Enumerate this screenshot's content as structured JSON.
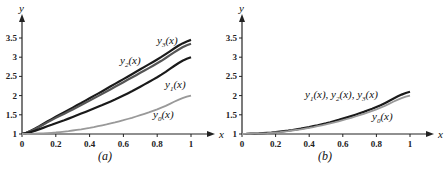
{
  "chart_data": [
    {
      "type": "line",
      "panel": "(a)",
      "caption": "(a)",
      "xlabel": "x",
      "ylabel": "y",
      "xlim": [
        0,
        1
      ],
      "ylim": [
        1,
        3.7
      ],
      "x_ticks": [
        "0",
        "0.2",
        "0.4",
        "0.6",
        "0.8",
        "1"
      ],
      "y_ticks": [
        "1",
        "1.5",
        "2",
        "2.5",
        "3",
        "3.5"
      ],
      "x": [
        0,
        0.2,
        0.4,
        0.6,
        0.8,
        1.0
      ],
      "series": [
        {
          "name": "y3(x)",
          "label": "y3(x)",
          "color": "#1a1a1a",
          "values": [
            1.0,
            1.45,
            1.93,
            2.43,
            2.94,
            3.45
          ]
        },
        {
          "name": "y2(x)",
          "label": "y2(x)",
          "color": "#555555",
          "values": [
            1.0,
            1.42,
            1.87,
            2.35,
            2.84,
            3.35
          ]
        },
        {
          "name": "y1(x)",
          "label": "y1(x)",
          "color": "#1a1a1a",
          "values": [
            1.0,
            1.28,
            1.62,
            2.0,
            2.48,
            3.0
          ]
        },
        {
          "name": "y0(x)",
          "label": "y0(x)",
          "color": "#999999",
          "values": [
            1.0,
            1.04,
            1.16,
            1.36,
            1.64,
            2.0
          ]
        }
      ],
      "grid": false
    },
    {
      "type": "line",
      "panel": "(b)",
      "caption": "(b)",
      "xlabel": "x",
      "ylabel": "y",
      "xlim": [
        0,
        1
      ],
      "ylim": [
        1,
        3.7
      ],
      "x_ticks": [
        "0",
        "0.2",
        "0.4",
        "0.6",
        "0.8",
        "1"
      ],
      "y_ticks": [
        "1",
        "1.5",
        "2",
        "2.5",
        "3",
        "3.5"
      ],
      "x": [
        0,
        0.2,
        0.4,
        0.6,
        0.8,
        1.0
      ],
      "series": [
        {
          "name": "y1(x), y2(x), y3(x)",
          "label": "y1(x), y2(x), y3(x)",
          "color": "#1a1a1a",
          "values": [
            1.0,
            1.05,
            1.18,
            1.4,
            1.7,
            2.1
          ]
        },
        {
          "name": "y0(x)",
          "label": "y0(x)",
          "color": "#999999",
          "values": [
            1.0,
            1.04,
            1.16,
            1.36,
            1.64,
            2.0
          ]
        }
      ],
      "grid": false
    }
  ]
}
